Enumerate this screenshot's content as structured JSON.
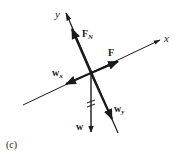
{
  "figure": {
    "panel_label": "(c)",
    "colors": {
      "ink": "#1a1a1a",
      "background": "#ffffff"
    },
    "axes": {
      "x": {
        "label": "x"
      },
      "y": {
        "label": "y"
      }
    },
    "vectors": [
      {
        "id": "normal-force",
        "label": "F",
        "subscript": "N"
      },
      {
        "id": "applied-force",
        "label": "F",
        "subscript": ""
      },
      {
        "id": "weight-x",
        "label": "w",
        "subscript": "x"
      },
      {
        "id": "weight-y",
        "label": "w",
        "subscript": "y"
      },
      {
        "id": "weight",
        "label": "w",
        "subscript": ""
      }
    ]
  }
}
